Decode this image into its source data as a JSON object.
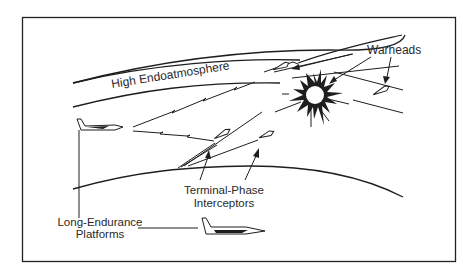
{
  "diagram": {
    "labels": {
      "atmosphere_band": "High Endoatmosphere",
      "warheads": "Warheads",
      "interceptors_line1": "Terminal-Phase",
      "interceptors_line2": "Interceptors",
      "platforms_line1": "Long-Endurance",
      "platforms_line2": "Platforms"
    },
    "elements": [
      {
        "id": "frame",
        "type": "border"
      },
      {
        "id": "upper-atmosphere-arc",
        "type": "curve"
      },
      {
        "id": "lower-atmosphere-arc",
        "type": "curve"
      },
      {
        "id": "earth-horizon",
        "type": "curve"
      },
      {
        "id": "platform-aircraft-upper",
        "type": "aircraft-icon"
      },
      {
        "id": "platform-aircraft-lower",
        "type": "aircraft-icon"
      },
      {
        "id": "laser-beam-upper",
        "type": "zigzag-line"
      },
      {
        "id": "laser-beam-lower",
        "type": "zigzag-line"
      },
      {
        "id": "explosion",
        "type": "starburst-icon"
      },
      {
        "id": "warhead-upper",
        "type": "warhead-icon"
      },
      {
        "id": "warhead-right",
        "type": "warhead-icon"
      },
      {
        "id": "interceptor-left",
        "type": "missile-icon"
      },
      {
        "id": "interceptor-right",
        "type": "missile-icon"
      }
    ],
    "colors": {
      "line": "#1e1e1e",
      "text": "#2a2a2a",
      "background": "#ffffff"
    }
  }
}
